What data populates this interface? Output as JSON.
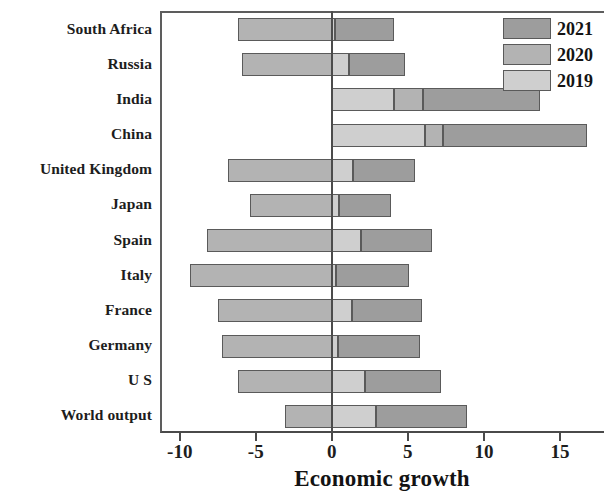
{
  "chart_data": {
    "type": "bar",
    "orientation": "horizontal",
    "stacked": false,
    "title": "",
    "xlabel": "Economic growth",
    "ylabel": "",
    "xlim": [
      -11.3,
      17.9
    ],
    "xticks": [
      -10,
      -5,
      0,
      5,
      10,
      15
    ],
    "xtick_labels": [
      "-10",
      "-5",
      "0",
      "5",
      "10",
      "15"
    ],
    "grid": false,
    "legend_position": "top-right",
    "categories": [
      "South Africa",
      "Russia",
      "India",
      "China",
      "United Kingdom",
      "Japan",
      "Spain",
      "Italy",
      "France",
      "Germany",
      "U S",
      "World output"
    ],
    "series": [
      {
        "name": "2019",
        "color": "#cfcfcf",
        "values": [
          0.2,
          1.1,
          4.1,
          6.1,
          1.4,
          0.5,
          1.9,
          0.3,
          1.3,
          0.4,
          2.2,
          2.9
        ]
      },
      {
        "name": "2020",
        "color": "#b3b3b3",
        "values": [
          -6.2,
          -5.9,
          6.0,
          7.3,
          -6.8,
          -5.4,
          -8.2,
          -9.3,
          -7.5,
          -7.2,
          -6.2,
          -3.1
        ]
      },
      {
        "name": "2021",
        "color": "#9d9d9d",
        "values": [
          4.1,
          4.8,
          13.7,
          16.8,
          5.5,
          3.9,
          6.6,
          5.1,
          5.9,
          5.8,
          7.2,
          8.9
        ]
      }
    ]
  },
  "legend": {
    "entries": [
      {
        "label": "2021",
        "color": "#9d9d9d"
      },
      {
        "label": "2020",
        "color": "#b3b3b3"
      },
      {
        "label": "2019",
        "color": "#cfcfcf"
      }
    ]
  },
  "axis": {
    "x_title": "Economic growth",
    "x_tick_labels": [
      "-10",
      "-5",
      "0",
      "5",
      "10",
      "15"
    ]
  },
  "colors": {
    "frame": "#5d5d5d",
    "zero_line": "#4c4c4c",
    "bar_border": "#5a5a5a",
    "text": "#1d1d1d",
    "background": "#ffffff"
  }
}
